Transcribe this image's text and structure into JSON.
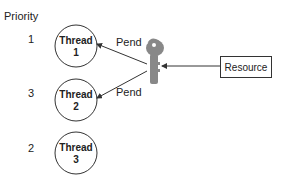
{
  "priority_header": "Priority",
  "threads": [
    {
      "priority": "1",
      "name": "Thread",
      "num": "1"
    },
    {
      "priority": "3",
      "name": "Thread",
      "num": "2"
    },
    {
      "priority": "2",
      "name": "Thread",
      "num": "3"
    }
  ],
  "pend_labels": [
    "Pend",
    "Pend"
  ],
  "resource_label": "Resource",
  "key_icon": "key-icon"
}
